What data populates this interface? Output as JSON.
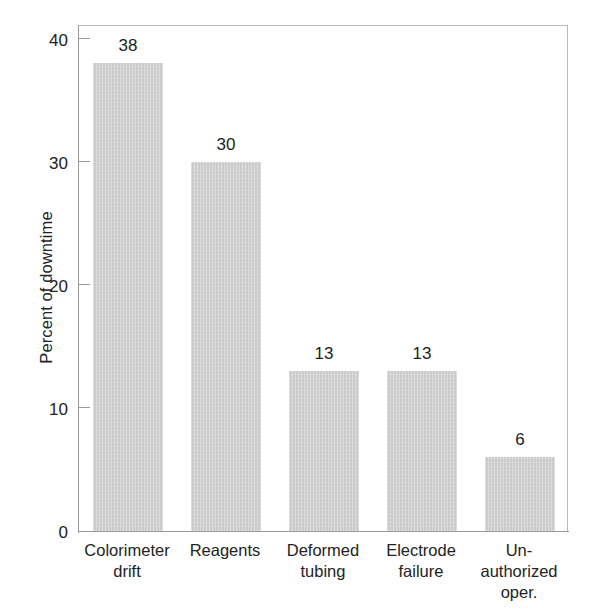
{
  "chart_data": {
    "type": "bar",
    "title": "",
    "subtitle": "",
    "xlabel": "",
    "ylabel": "Percent of downtime",
    "ylim": [
      0,
      41.2
    ],
    "yticks": [
      0,
      10,
      20,
      30,
      40
    ],
    "ytick_labels": [
      "0",
      "10",
      "20",
      "30",
      "40"
    ],
    "grid": false,
    "legend": null,
    "bar_color": "#c9c9c9",
    "frame_color": "#9a9a9a",
    "categories": [
      "Colorimeter drift",
      "Reagents",
      "Deformed tubing",
      "Electrode failure",
      "Un-authorized oper."
    ],
    "category_lines": [
      [
        "Colorimeter",
        "drift"
      ],
      [
        "Reagents"
      ],
      [
        "Deformed",
        "tubing"
      ],
      [
        "Electrode",
        "failure"
      ],
      [
        "Un-",
        "authorized",
        "oper."
      ]
    ],
    "values": [
      38,
      30,
      13,
      13,
      6
    ],
    "value_labels": [
      "38",
      "30",
      "13",
      "13",
      "6"
    ]
  }
}
